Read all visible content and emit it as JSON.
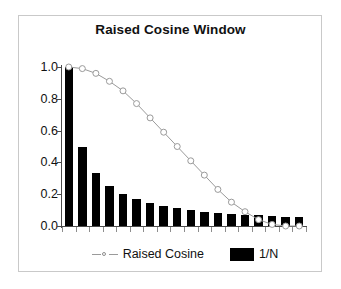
{
  "chart_data": {
    "type": "bar",
    "title": "Raised Cosine Window",
    "xlabel": "",
    "ylabel": "",
    "ylim": [
      0.0,
      1.0
    ],
    "ytick_labels": [
      "1.0",
      "0.8",
      "0.6",
      "0.4",
      "0.2",
      "0.0"
    ],
    "ytick_values": [
      1.0,
      0.8,
      0.6,
      0.4,
      0.2,
      0.0
    ],
    "grid": false,
    "legend_position": "bottom-center",
    "categories": [
      "1",
      "2",
      "3",
      "4",
      "5",
      "6",
      "7",
      "8",
      "9",
      "10",
      "11",
      "12",
      "13",
      "14",
      "15",
      "16",
      "17",
      "18"
    ],
    "series": [
      {
        "name": "Raised Cosine",
        "type": "line",
        "marker": "open-circle",
        "color": "#9a9a9a",
        "values": [
          1.0,
          0.99,
          0.96,
          0.91,
          0.85,
          0.77,
          0.68,
          0.59,
          0.5,
          0.41,
          0.32,
          0.23,
          0.15,
          0.09,
          0.04,
          0.01,
          0.0,
          0.0
        ]
      },
      {
        "name": "1/N",
        "type": "bar",
        "color": "#000000",
        "values": [
          1.0,
          0.5,
          0.333,
          0.25,
          0.2,
          0.167,
          0.143,
          0.125,
          0.111,
          0.1,
          0.091,
          0.083,
          0.077,
          0.071,
          0.067,
          0.063,
          0.059,
          0.056
        ]
      }
    ]
  },
  "legend": {
    "entries": [
      {
        "label": "Raised Cosine",
        "marker": "line-circle-marker"
      },
      {
        "label": "1/N",
        "marker": "filled-black-square"
      }
    ]
  },
  "colors": {
    "bar": "#000000",
    "line": "#9a9a9a",
    "axis": "#4a4a4a",
    "frame": "#c9c9c9",
    "text": "#111111",
    "background": "#ffffff"
  }
}
